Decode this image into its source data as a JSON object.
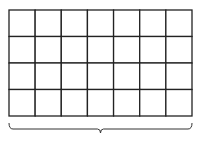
{
  "diagram": {
    "grid": {
      "columns": 7,
      "rows": 4,
      "x": 9,
      "y": 10,
      "width": 183,
      "height": 106,
      "line_color": "#222222",
      "fill_color": "#ffffff"
    },
    "brace": {
      "orientation": "horizontal-under",
      "x_start": 9,
      "x_end": 192,
      "y_top": 123,
      "y_bottom": 129,
      "tip_y": 133,
      "color": "#333333"
    }
  }
}
